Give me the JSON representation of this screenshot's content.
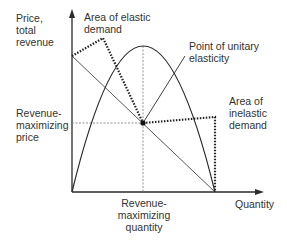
{
  "diagram": {
    "type": "economics-revenue-elasticity",
    "y_axis_label": "Price,\ntotal\nrevenue",
    "x_axis_label": "Quantity",
    "annotations": {
      "elastic": "Area of elastic\ndemand",
      "unitary": "Point of unitary\nelasticity",
      "inelastic": "Area of\ninelastic\ndemand",
      "rev_max_price": "Revenue-\nmaximizing\nprice",
      "rev_max_quantity": "Revenue-\nmaximizing\nquantity"
    },
    "curves": [
      {
        "name": "demand-line",
        "shape": "straight line",
        "from": "price intercept",
        "to": "quantity intercept"
      },
      {
        "name": "total-revenue-curve",
        "shape": "inverted parabola",
        "peak_at": "revenue-maximizing quantity"
      }
    ],
    "colors": {
      "line": "#2a2a2a",
      "text": "#333333",
      "dashed": "#888888"
    }
  }
}
